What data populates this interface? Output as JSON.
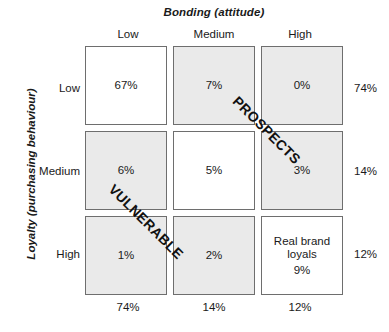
{
  "chart_data": {
    "type": "heatmap",
    "xlabel": "Bonding (attitude)",
    "ylabel": "Loyalty (purchasing behaviour)",
    "categories_x": [
      "Low",
      "Medium",
      "High"
    ],
    "categories_y": [
      "Low",
      "Medium",
      "High"
    ],
    "cells": [
      {
        "row": "Low",
        "col": "Low",
        "value": "67%",
        "name": "",
        "shaded": false
      },
      {
        "row": "Low",
        "col": "Medium",
        "value": "7%",
        "name": "",
        "shaded": true
      },
      {
        "row": "Low",
        "col": "High",
        "value": "0%",
        "name": "",
        "shaded": true
      },
      {
        "row": "Medium",
        "col": "Low",
        "value": "6%",
        "name": "",
        "shaded": true
      },
      {
        "row": "Medium",
        "col": "Medium",
        "value": "5%",
        "name": "",
        "shaded": false
      },
      {
        "row": "Medium",
        "col": "High",
        "value": "3%",
        "name": "",
        "shaded": true
      },
      {
        "row": "High",
        "col": "Low",
        "value": "1%",
        "name": "",
        "shaded": true
      },
      {
        "row": "High",
        "col": "Medium",
        "value": "2%",
        "name": "",
        "shaded": true
      },
      {
        "row": "High",
        "col": "High",
        "value": "9%",
        "name": "Real brand loyals",
        "shaded": false
      }
    ],
    "row_totals": [
      "74%",
      "14%",
      "12%"
    ],
    "col_totals": [
      "74%",
      "14%",
      "12%"
    ],
    "annotations": [
      {
        "text": "PROSPECTS",
        "rotation": 45
      },
      {
        "text": "VULNERABLE",
        "rotation": 45
      }
    ],
    "colors": {
      "shaded_cell": "#eaeaea",
      "plain_cell": "#ffffff",
      "cell_border": "#6e6e6e",
      "text": "#1a1a1a",
      "background": "#ffffff"
    },
    "grid": true,
    "legend": "none"
  },
  "axes": {
    "x_title": "Bonding (attitude)",
    "y_title": "Loyalty (purchasing behaviour)",
    "col_headers": [
      "Low",
      "Medium",
      "High"
    ],
    "row_labels": [
      "Low",
      "Medium",
      "High"
    ]
  },
  "matrix": {
    "cells": [
      {
        "value": "67%",
        "name": ""
      },
      {
        "value": "7%",
        "name": ""
      },
      {
        "value": "0%",
        "name": ""
      },
      {
        "value": "6%",
        "name": ""
      },
      {
        "value": "5%",
        "name": ""
      },
      {
        "value": "3%",
        "name": ""
      },
      {
        "value": "1%",
        "name": ""
      },
      {
        "value": "2%",
        "name": ""
      },
      {
        "value": "9%",
        "name": "Real brand loyals"
      }
    ]
  },
  "totals": {
    "rows": [
      "74%",
      "14%",
      "12%"
    ],
    "cols": [
      "74%",
      "14%",
      "12%"
    ]
  },
  "annotations": {
    "prospects": "PROSPECTS",
    "vulnerable": "VULNERABLE"
  }
}
